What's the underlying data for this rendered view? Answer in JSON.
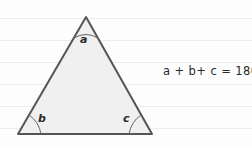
{
  "figure": {
    "background_color": "#fdfdfd",
    "ruled_line_color": "#ececec",
    "ruled_line_y": [
      18,
      40,
      62,
      84,
      106,
      128
    ]
  },
  "triangle": {
    "fill_color": "#f0f0f0",
    "stroke_color": "#555555",
    "stroke_width": 2,
    "vertices": {
      "apex": {
        "x": 86,
        "y": 17
      },
      "bottom_left": {
        "x": 18,
        "y": 134
      },
      "bottom_right": {
        "x": 152,
        "y": 134
      }
    }
  },
  "angles": [
    {
      "id": "apex",
      "label": "a",
      "label_x": 80,
      "label_y": 34
    },
    {
      "id": "bottom-left",
      "label": "b",
      "label_x": 38,
      "label_y": 113
    },
    {
      "id": "bottom-right",
      "label": "c",
      "label_x": 123,
      "label_y": 113
    }
  ],
  "equation": {
    "text": "a + b+ c = 180",
    "degree_symbol": "°",
    "x": 163,
    "y": 65
  }
}
